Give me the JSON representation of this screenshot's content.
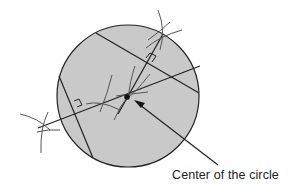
{
  "diagram": {
    "circle": {
      "cx": 128,
      "cy": 96,
      "r": 71,
      "fill": "#c9c9c9",
      "stroke": "#222222"
    },
    "chords": [
      {
        "id": "chord-1",
        "x1": 96,
        "y1": 33,
        "x2": 199,
        "y2": 93
      },
      {
        "id": "chord-2",
        "x1": 59,
        "y1": 76,
        "x2": 93,
        "y2": 158
      }
    ],
    "bisectors": [
      {
        "id": "bisector-1",
        "x1": 163,
        "y1": 34,
        "x2": 118,
        "y2": 114
      },
      {
        "id": "bisector-2",
        "x1": 38,
        "y1": 128,
        "x2": 200,
        "y2": 66
      }
    ],
    "center_point": {
      "x": 127,
      "y": 97
    },
    "annotation": {
      "label": "Center of the circle",
      "arrow": {
        "x1": 218,
        "y1": 165,
        "x2": 135,
        "y2": 101
      }
    },
    "colors": {
      "fill": "#c9c9c9",
      "line": "#222222",
      "arc": "#555555",
      "text": "#222222"
    }
  }
}
